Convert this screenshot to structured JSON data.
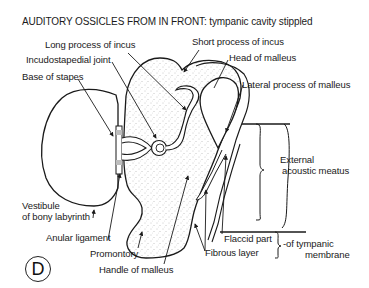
{
  "title": "AUDITORY OSSICLES FROM IN FRONT: tympanic cavity stippled",
  "figure_letter": "D",
  "labels": {
    "long_process_incus": "Long process of incus",
    "short_process_incus": "Short process of incus",
    "incudostapedial_joint": "Incudostapedial joint",
    "head_malleus": "Head of malleus",
    "base_stapes": "Base of stapes",
    "lateral_process_malleus": "Lateral process of malleus",
    "external_meatus_1": "External",
    "external_meatus_2": "acoustic meatus",
    "vestibule_1": "Vestibule",
    "vestibule_2": "of bony labyrinth",
    "anular_ligament": "Anular ligament",
    "promontory": "Promontory",
    "handle_malleus": "Handle of malleus",
    "flaccid_part": "Flaccid part",
    "fibrous_layer": "Fibrous layer",
    "tympanic_1": "-of tympanic",
    "tympanic_2": "membrane"
  },
  "colors": {
    "ink": "#1a1a1a",
    "stipple": "#8a8a8a",
    "background": "#ffffff"
  }
}
